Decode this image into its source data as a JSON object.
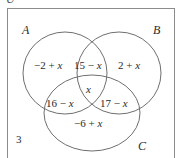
{
  "diagram": {
    "type": "venn-3-set",
    "universe_letter": "U",
    "outside_count": "3",
    "sets": [
      {
        "id": "A",
        "label": "A"
      },
      {
        "id": "B",
        "label": "B"
      },
      {
        "id": "C",
        "label": "C"
      }
    ],
    "regions": [
      {
        "id": "a-only",
        "name": "A only",
        "text": "−2 + x"
      },
      {
        "id": "ab",
        "name": "A and B only",
        "text": "15 − x"
      },
      {
        "id": "b-only",
        "name": "B only",
        "text": "2 + x"
      },
      {
        "id": "abc",
        "name": "A and B and C",
        "text": "x"
      },
      {
        "id": "ac",
        "name": "A and C only",
        "text": "16 − x"
      },
      {
        "id": "bc",
        "name": "B and C only",
        "text": "17 − x"
      },
      {
        "id": "c-only",
        "name": "C only",
        "text": "−6 + x"
      }
    ],
    "colors": {
      "stroke": "#6f6f6f",
      "frame": "#8c8c8c",
      "text": "#2b2b2b",
      "background": "#ffffff"
    }
  }
}
